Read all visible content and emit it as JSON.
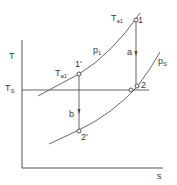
{
  "diagram": {
    "type": "T-s diagram",
    "axes": {
      "y_label": "T",
      "x_label": "s"
    },
    "reference_line": {
      "label_main": "T",
      "label_sub": "S"
    },
    "isobars": [
      {
        "label_main": "p",
        "label_sub": "1"
      },
      {
        "label_main": "p",
        "label_sub": "S"
      }
    ],
    "points": [
      {
        "id": "1",
        "label": "1"
      },
      {
        "id": "1'",
        "label": "1'"
      },
      {
        "id": "2",
        "label": "2"
      },
      {
        "id": "2'",
        "label": "2'"
      }
    ],
    "temperature_labels": [
      {
        "label_main": "T",
        "label_sub": "a1"
      },
      {
        "label_main": "T",
        "label_sub": "a1'"
      }
    ],
    "processes": [
      {
        "label": "a",
        "from": "1",
        "to": "2"
      },
      {
        "label": "b",
        "from": "1'",
        "to": "2'"
      }
    ],
    "colors": {
      "line": "#4a4a4a",
      "background": "#ffffff"
    }
  }
}
